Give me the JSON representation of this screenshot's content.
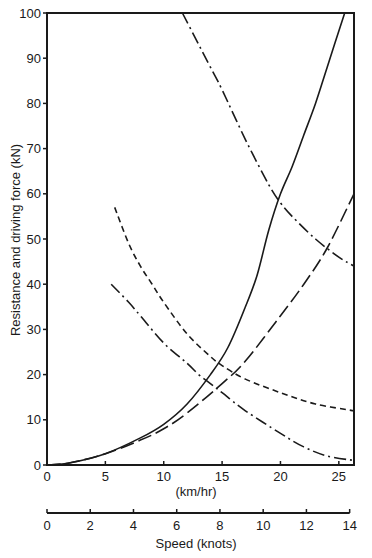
{
  "chart_data": {
    "type": "line",
    "title": "",
    "xlabel": "(km/hr)",
    "xlabel_secondary": "Speed (knots)",
    "ylabel": "Resistance and driving force (kN)",
    "xlim": [
      0,
      26.3
    ],
    "ylim": [
      0,
      100
    ],
    "x_ticks": [
      0,
      5,
      10,
      15,
      20,
      25
    ],
    "y_ticks": [
      0,
      10,
      20,
      30,
      40,
      50,
      60,
      70,
      80,
      90,
      100
    ],
    "knots_ticks": [
      0,
      2,
      4,
      6,
      8,
      10,
      12,
      14
    ],
    "grid": false,
    "legend": "none",
    "series": [
      {
        "name": "resistance-solid",
        "style": "solid",
        "points": [
          [
            0,
            0
          ],
          [
            2,
            0.5
          ],
          [
            5,
            2.5
          ],
          [
            8,
            6
          ],
          [
            10,
            9
          ],
          [
            12,
            13.5
          ],
          [
            14,
            20
          ],
          [
            15.5,
            26
          ],
          [
            17,
            35
          ],
          [
            18,
            42
          ],
          [
            19,
            52
          ],
          [
            20,
            60
          ],
          [
            21,
            66
          ],
          [
            22,
            73
          ],
          [
            23,
            80
          ],
          [
            24,
            88
          ],
          [
            25.5,
            100
          ]
        ]
      },
      {
        "name": "resistance-long-dash",
        "style": "long-dash",
        "points": [
          [
            0,
            0
          ],
          [
            2,
            0.5
          ],
          [
            5,
            2.5
          ],
          [
            8,
            5.5
          ],
          [
            10,
            8
          ],
          [
            12,
            11.5
          ],
          [
            15,
            18
          ],
          [
            17,
            23
          ],
          [
            20,
            33
          ],
          [
            22,
            40
          ],
          [
            24,
            48
          ],
          [
            26.3,
            60
          ]
        ]
      },
      {
        "name": "driving-force-short-dash",
        "style": "short-dash",
        "points": [
          [
            5.8,
            57
          ],
          [
            7,
            49
          ],
          [
            8,
            44
          ],
          [
            9,
            40
          ],
          [
            10,
            36
          ],
          [
            12,
            29
          ],
          [
            14,
            24
          ],
          [
            15,
            22
          ],
          [
            17,
            19
          ],
          [
            20,
            16
          ],
          [
            23,
            13.5
          ],
          [
            26.3,
            12
          ]
        ]
      },
      {
        "name": "driving-force-dash-dot-lower",
        "style": "dash-dot",
        "points": [
          [
            5.5,
            40
          ],
          [
            7,
            36
          ],
          [
            8,
            33
          ],
          [
            10,
            27
          ],
          [
            12,
            22.5
          ],
          [
            13,
            20
          ],
          [
            14,
            18
          ],
          [
            15,
            16
          ],
          [
            17,
            12
          ],
          [
            20,
            7
          ],
          [
            22,
            4
          ],
          [
            24,
            2
          ],
          [
            26.3,
            1
          ]
        ]
      },
      {
        "name": "driving-force-dash-dot-upper",
        "style": "dash-dot",
        "points": [
          [
            11.6,
            100
          ],
          [
            13,
            93
          ],
          [
            14,
            88
          ],
          [
            15,
            83
          ],
          [
            17,
            72
          ],
          [
            19,
            62
          ],
          [
            20,
            58
          ],
          [
            21,
            55
          ],
          [
            23,
            50
          ],
          [
            25,
            46
          ],
          [
            26.3,
            44
          ]
        ]
      }
    ]
  }
}
